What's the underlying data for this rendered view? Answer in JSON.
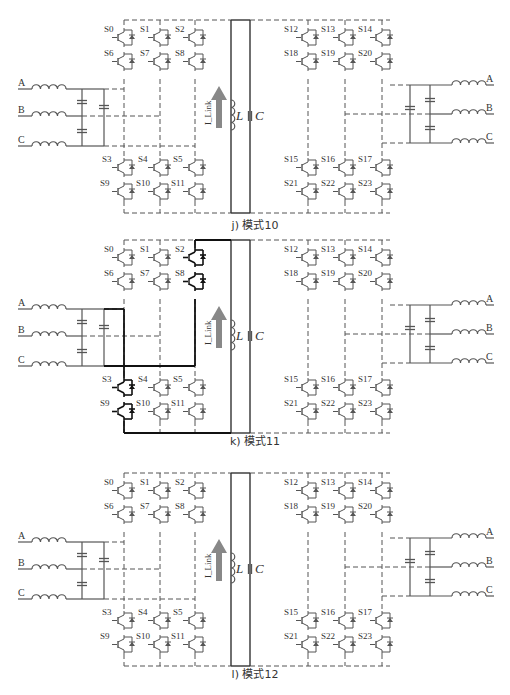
{
  "figure": {
    "panels": [
      {
        "id": "j",
        "caption": "j) 模式10",
        "left_switches_top": [
          "S0",
          "S1",
          "S2",
          "S6",
          "S7",
          "S8"
        ],
        "left_switches_bottom": [
          "S3",
          "S4",
          "S5",
          "S9",
          "S10",
          "S11"
        ],
        "right_switches_top": [
          "S12",
          "S13",
          "S14",
          "S18",
          "S19",
          "S20"
        ],
        "right_switches_bottom": [
          "S15",
          "S16",
          "S17",
          "S21",
          "S22",
          "S23"
        ],
        "active_path": "dc-link freewheel (L and C only)"
      },
      {
        "id": "k",
        "caption": "k) 模式11",
        "left_switches_top": [
          "S0",
          "S1",
          "S2",
          "S6",
          "S7",
          "S8"
        ],
        "left_switches_bottom": [
          "S3",
          "S4",
          "S5",
          "S9",
          "S10",
          "S11"
        ],
        "right_switches_top": [
          "S12",
          "S13",
          "S14",
          "S18",
          "S19",
          "S20"
        ],
        "right_switches_bottom": [
          "S15",
          "S16",
          "S17",
          "S21",
          "S22",
          "S23"
        ],
        "active_path": "S2, S8, S3, S9 conducting via phase A and C"
      },
      {
        "id": "l",
        "caption": "l) 模式12",
        "left_switches_top": [
          "S0",
          "S1",
          "S2",
          "S6",
          "S7",
          "S8"
        ],
        "left_switches_bottom": [
          "S3",
          "S4",
          "S5",
          "S9",
          "S10",
          "S11"
        ],
        "right_switches_top": [
          "S12",
          "S13",
          "S14",
          "S18",
          "S19",
          "S20"
        ],
        "right_switches_bottom": [
          "S15",
          "S16",
          "S17",
          "S21",
          "S22",
          "S23"
        ],
        "active_path": "dc-link freewheel (L and C only)"
      }
    ],
    "phase_labels": [
      "A",
      "B",
      "C"
    ],
    "inductor_label": "L",
    "capacitor_label": "C",
    "current_label": "I_Link"
  }
}
